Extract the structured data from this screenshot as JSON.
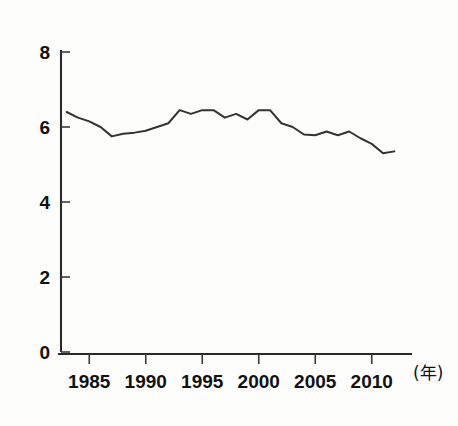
{
  "chart_data": {
    "type": "line",
    "title": "",
    "subtitle": "",
    "xlabel": "(年)",
    "ylabel": "",
    "xlim": [
      1982.5,
      2012.5
    ],
    "ylim": [
      0,
      8
    ],
    "grid": false,
    "legend": null,
    "y_ticks": [
      0,
      2,
      4,
      6,
      8
    ],
    "y_tick_labels": [
      "0",
      "2",
      "4",
      "6",
      "8"
    ],
    "x_ticks": [
      1985,
      1990,
      1995,
      2000,
      2005,
      2010
    ],
    "x_tick_labels": [
      "1985",
      "1990",
      "1995",
      "2000",
      "2005",
      "2010"
    ],
    "x": [
      1983,
      1984,
      1985,
      1986,
      1987,
      1988,
      1989,
      1990,
      1991,
      1992,
      1993,
      1994,
      1995,
      1996,
      1997,
      1998,
      1999,
      2000,
      2001,
      2002,
      2003,
      2004,
      2005,
      2006,
      2007,
      2008,
      2009,
      2010,
      2011,
      2012
    ],
    "values": [
      6.4,
      6.25,
      6.15,
      6.0,
      5.75,
      5.82,
      5.85,
      5.9,
      6.0,
      6.1,
      6.45,
      6.35,
      6.45,
      6.45,
      6.25,
      6.35,
      6.2,
      6.45,
      6.45,
      6.1,
      6.0,
      5.8,
      5.78,
      5.88,
      5.78,
      5.88,
      5.7,
      5.55,
      5.3,
      5.35
    ],
    "series_name": "",
    "annotations": []
  },
  "axis": {
    "x_unit_label": "(年)"
  },
  "colors": {
    "line": "#333333",
    "axis": "#2a2a2a",
    "text": "#111111",
    "background": "#fdfdfc"
  }
}
